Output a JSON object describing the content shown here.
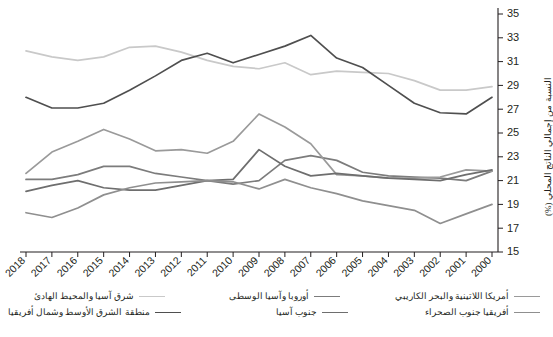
{
  "chart_data": {
    "type": "line",
    "title": "",
    "xlabel": "",
    "ylabel": "النسبة من إجمالي الناتج المحلي (%)",
    "ylim": [
      15,
      35
    ],
    "yticks": [
      15,
      17,
      19,
      21,
      23,
      25,
      27,
      29,
      31,
      33,
      35
    ],
    "grid": false,
    "legend_position": "bottom",
    "x_axis_direction": "descending",
    "categories": [
      "2018",
      "2017",
      "2016",
      "2015",
      "2014",
      "2013",
      "2012",
      "2011",
      "2010",
      "2009",
      "2008",
      "2007",
      "2006",
      "2005",
      "2004",
      "2003",
      "2002",
      "2001",
      "2000"
    ],
    "series": [
      {
        "name": "شرق آسيا والمحيط الهادئ",
        "color": "#c9c9c9",
        "values": [
          31.9,
          31.4,
          31.1,
          31.4,
          32.2,
          32.3,
          31.8,
          31.1,
          30.6,
          30.4,
          30.9,
          29.9,
          30.2,
          30.1,
          30.0,
          29.4,
          28.6,
          28.6,
          28.9
        ]
      },
      {
        "name": "أوروبا وآسيا الوسطى",
        "color": "#7c7c7c",
        "values": [
          21.1,
          21.1,
          21.5,
          22.2,
          22.2,
          21.6,
          21.3,
          21.0,
          20.7,
          21.0,
          22.7,
          23.1,
          22.7,
          21.7,
          21.4,
          21.3,
          21.2,
          21.0,
          21.8
        ]
      },
      {
        "name": "أمريكا اللاتينية والبحر الكاريبي",
        "color": "#9a9a9a",
        "values": [
          21.6,
          23.4,
          24.3,
          25.3,
          24.5,
          23.5,
          23.6,
          23.3,
          24.3,
          26.6,
          25.5,
          24.1,
          21.5,
          21.4,
          21.2,
          21.2,
          21.3,
          21.9,
          21.8
        ]
      },
      {
        "name": "منطقة الشرق الأوسط وشمال أفريقيا",
        "color": "#4f4f4f",
        "values": [
          28.0,
          27.1,
          27.1,
          27.5,
          28.6,
          29.8,
          31.1,
          31.7,
          30.9,
          31.6,
          32.3,
          33.2,
          31.3,
          30.5,
          29.0,
          27.5,
          26.7,
          26.6,
          28.0
        ]
      },
      {
        "name": "جنوب آسيا",
        "color": "#6e6e6e",
        "values": [
          20.1,
          20.6,
          21.0,
          20.4,
          20.2,
          20.2,
          20.6,
          21.0,
          21.1,
          23.6,
          22.2,
          21.4,
          21.6,
          21.4,
          21.2,
          21.1,
          21.0,
          21.5,
          21.9
        ]
      },
      {
        "name": "أفريقيا جنوب الصحراء",
        "color": "#8f8f8f",
        "values": [
          18.3,
          17.9,
          18.7,
          19.8,
          20.4,
          20.8,
          20.9,
          21.0,
          20.9,
          20.3,
          21.1,
          20.4,
          19.9,
          19.3,
          18.9,
          18.5,
          17.4,
          18.2,
          19.0
        ]
      }
    ]
  },
  "legend": {
    "rows": [
      [
        {
          "label": "شرق آسيا والمحيط الهادئ",
          "color": "#c9c9c9",
          "width": 1.7
        },
        {
          "label": "أوروبا وآسيا الوسطى",
          "color": "#7c7c7c",
          "width": 1.7
        },
        {
          "label": "أمريكا اللاتينية والبحر الكاريبي",
          "color": "#9a9a9a",
          "width": 1.7
        }
      ],
      [
        {
          "label": "منطقة الشرق الأوسط وشمال أفريقيا",
          "color": "#4f4f4f",
          "width": 1.7
        },
        {
          "label": "جنوب آسيا",
          "color": "#6e6e6e",
          "width": 1.7
        },
        {
          "label": "أفريقيا جنوب الصحراء",
          "color": "#8f8f8f",
          "width": 1.7
        }
      ]
    ]
  }
}
